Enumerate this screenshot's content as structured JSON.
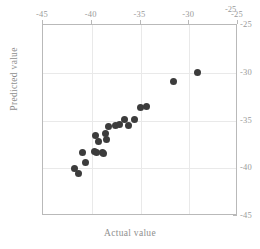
{
  "chart_data": {
    "type": "scatter",
    "title": "",
    "xlabel": "Actual value",
    "ylabel": "Predicted value",
    "xlim": [
      -45,
      -25
    ],
    "ylim": [
      -45,
      -25
    ],
    "xticks": [
      -45,
      -40,
      -35,
      -30,
      -25
    ],
    "xticklabels": [
      "-45",
      "-40",
      "-35",
      "-30",
      "-25"
    ],
    "yticks": [
      -45,
      -40,
      -35,
      -30,
      -25
    ],
    "yticklabels": [
      "-45",
      "-40",
      "-35",
      "-30",
      "-25"
    ],
    "x_axis_position": "top",
    "y_axis_position": "right",
    "grid": true,
    "legend": null,
    "marker": "filled-circle",
    "marker_color": "#3c3c3c",
    "frame_color": "#b9b9b9",
    "grid_color": "#e9e9e9",
    "corner_label": "-25",
    "points": [
      {
        "x": -41.8,
        "y": -40.0
      },
      {
        "x": -41.4,
        "y": -40.6
      },
      {
        "x": -40.9,
        "y": -38.3
      },
      {
        "x": -40.6,
        "y": -39.4
      },
      {
        "x": -39.7,
        "y": -38.2
      },
      {
        "x": -39.5,
        "y": -38.4
      },
      {
        "x": -39.6,
        "y": -36.6
      },
      {
        "x": -39.3,
        "y": -37.2
      },
      {
        "x": -38.9,
        "y": -38.3
      },
      {
        "x": -38.8,
        "y": -38.5
      },
      {
        "x": -38.6,
        "y": -36.4
      },
      {
        "x": -38.5,
        "y": -37.0
      },
      {
        "x": -38.3,
        "y": -35.6
      },
      {
        "x": -37.6,
        "y": -35.5
      },
      {
        "x": -37.2,
        "y": -35.4
      },
      {
        "x": -36.6,
        "y": -34.9
      },
      {
        "x": -36.2,
        "y": -35.5
      },
      {
        "x": -35.6,
        "y": -34.9
      },
      {
        "x": -35.0,
        "y": -33.6
      },
      {
        "x": -34.4,
        "y": -33.5
      },
      {
        "x": -31.6,
        "y": -30.9
      },
      {
        "x": -29.2,
        "y": -30.0
      }
    ]
  }
}
